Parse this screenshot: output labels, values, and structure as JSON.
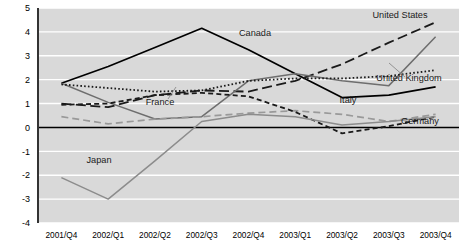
{
  "chart_data": {
    "type": "line",
    "title": "",
    "subtitle": "",
    "xlabel": "",
    "ylabel": "",
    "categories": [
      "2001/Q4",
      "2002/Q1",
      "2002/Q2",
      "2002/Q3",
      "2002/Q4",
      "2003/Q1",
      "2003/Q2",
      "2003/Q3",
      "2003/Q4"
    ],
    "ylim": [
      -4,
      5
    ],
    "yticks": [
      5,
      4,
      3,
      2,
      1,
      0,
      -1,
      -2,
      -3,
      -4
    ],
    "ytick_labels": [
      "5",
      "4",
      "3",
      "2",
      "1",
      "0",
      "-1",
      "-2",
      "-3",
      "-4"
    ],
    "grid": true,
    "grid_color": "#ffffff",
    "plot_background": "#d9d9d9",
    "zero_line": 0,
    "legend": "inline-labels",
    "series": [
      {
        "name": "Canada",
        "label": "Canada",
        "color": "#000000",
        "style": "solid",
        "width": 1.7,
        "label_x": 255,
        "label_y": 36,
        "values": [
          1.85,
          2.55,
          3.35,
          4.15,
          3.25,
          2.25,
          1.25,
          1.35,
          1.7
        ]
      },
      {
        "name": "United States",
        "label": "United States",
        "color": "#1a1a1a",
        "style": "dashed-long",
        "width": 1.8,
        "label_x": 400,
        "label_y": 18,
        "values": [
          1.0,
          0.85,
          1.35,
          1.55,
          1.5,
          1.95,
          2.65,
          3.55,
          4.4
        ]
      },
      {
        "name": "United Kingdom",
        "label": "United Kingdom",
        "color": "#6e6e6e",
        "style": "solid",
        "width": 1.5,
        "label_x": 409,
        "label_y": 81,
        "values": [
          1.85,
          1.05,
          0.35,
          0.45,
          1.95,
          2.25,
          1.95,
          1.75,
          3.8
        ]
      },
      {
        "name": "France",
        "label": "France",
        "color": "#1a1a1a",
        "style": "dotted",
        "width": 1.8,
        "label_x": 160,
        "label_y": 105,
        "values": [
          1.8,
          1.65,
          1.5,
          1.55,
          1.95,
          2.05,
          2.05,
          2.15,
          2.4
        ]
      },
      {
        "name": "Italy",
        "label": "Italy",
        "color": "#999999",
        "style": "dashed-medium",
        "width": 1.7,
        "label_x": 348,
        "label_y": 103,
        "values": [
          0.45,
          0.15,
          0.35,
          0.45,
          0.6,
          0.7,
          0.55,
          0.25,
          0.55
        ]
      },
      {
        "name": "Germany",
        "label": "Germany",
        "color": "#1a1a1a",
        "style": "dashed-short",
        "width": 1.8,
        "label_x": 420,
        "label_y": 124,
        "values": [
          0.95,
          1.0,
          1.35,
          1.45,
          1.3,
          0.65,
          -0.25,
          0.05,
          0.45
        ]
      },
      {
        "name": "Japan",
        "label": "Japan",
        "color": "#8c8c8c",
        "style": "solid",
        "width": 1.5,
        "label_x": 99,
        "label_y": 163,
        "values": [
          -2.1,
          -3.0,
          -1.4,
          0.25,
          0.55,
          0.45,
          0.1,
          0.25,
          0.45
        ]
      }
    ],
    "annotations": [
      {
        "name": "france-leader-line",
        "from": [
          168,
          99
        ],
        "to": [
          176,
          87
        ]
      },
      {
        "name": "united-kingdom-leader-line",
        "from": [
          405,
          77
        ],
        "to": [
          389,
          63
        ]
      }
    ]
  }
}
